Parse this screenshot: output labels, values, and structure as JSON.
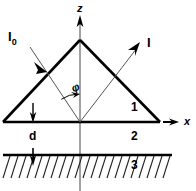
{
  "figure": {
    "type": "optics-prism-diagram",
    "width": 196,
    "height": 191,
    "background_color": "#ffffff",
    "line_color": "#000000",
    "ray_color": "#555555"
  },
  "axes": {
    "vertical": {
      "label": "z",
      "x": 80,
      "from_y": 191,
      "to_y": 18,
      "arrow": "up"
    },
    "horizontal": {
      "label": "x",
      "y": 122,
      "from_x": 3,
      "to_x": 178,
      "arrow": "right"
    }
  },
  "prism": {
    "apex": {
      "x": 80,
      "y": 40
    },
    "left_vertex": {
      "x": 3,
      "y": 122
    },
    "right_vertex": {
      "x": 160,
      "y": 122
    }
  },
  "rays": {
    "incident": {
      "label": "I",
      "subscript": "0",
      "label_x": 8,
      "label_y": 30,
      "from_x": 30,
      "from_y": 47,
      "to_x": 80,
      "to_y": 122
    },
    "outgoing": {
      "label": "I",
      "subscript": "",
      "label_x": 147,
      "label_y": 38,
      "from_x": 80,
      "from_y": 122,
      "to_x": 137,
      "to_y": 45
    }
  },
  "angle": {
    "label": "φ",
    "label_x": 71,
    "label_y": 85,
    "arc_radius": 28
  },
  "regions": [
    {
      "label": "1",
      "x": 131,
      "y": 104,
      "description": "prism-interior"
    },
    {
      "label": "2",
      "x": 131,
      "y": 131,
      "description": "gap-layer"
    },
    {
      "label": "3",
      "x": 131,
      "y": 160,
      "description": "substrate-hatched"
    }
  ],
  "gap": {
    "label": "d",
    "label_x": 29,
    "label_y": 130,
    "arrow_x": 33,
    "arrow_top_y": 104,
    "arrow_bottom_y": 122,
    "arrow2_top_y": 148,
    "arrow2_bottom_y": 164
  },
  "substrate": {
    "surface_y": 155,
    "surface_from_x": 3,
    "surface_to_x": 172,
    "hatch_count": 21,
    "hatch_spacing": 8,
    "hatch_length": 22,
    "hatch_slant": 7
  }
}
